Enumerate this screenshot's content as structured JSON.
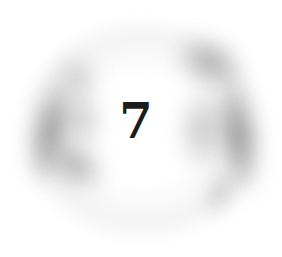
{
  "ornament": {
    "chapter_number": "7",
    "style": "grey charcoal swirl ring around numeral",
    "colors": {
      "background": "#ffffff",
      "numeral": "#1c1c1c",
      "smudge": "#707070"
    }
  }
}
